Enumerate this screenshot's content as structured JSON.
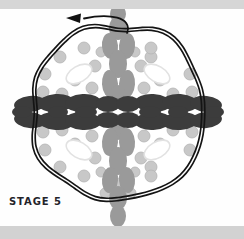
{
  "figure": {
    "title_label": "STAGE 5",
    "caption": "STAGE 5",
    "type": "biological-stage-diagram",
    "background": {
      "page_color": "#ffffff",
      "top_band_color": "#d6d6d6",
      "bottom_band_color": "#d2d2d2",
      "canvas_color": "#fefefe"
    },
    "colors": {
      "outline": "#141414",
      "dark_blob": "#3c3c3c",
      "medium_blob": "#9a9a9a",
      "light_dot": "#c8c8c8",
      "light_dot_stroke": "#b4b4b4",
      "outlined_blob_fill": "#ffffff",
      "outlined_blob_stroke": "#e2e2e2",
      "label_color": "#23232a",
      "arrow_color": "#111111"
    },
    "boundary": {
      "shape": "irregular-wavy-circle",
      "style": "double-line",
      "center_x": 118,
      "center_y": 112,
      "radius_x": 87,
      "radius_y": 88,
      "stroke_width": 1.7,
      "line_gap": 3.2
    },
    "arrow": {
      "name": "rotation-arrow",
      "direction": "left",
      "head_x": 66,
      "head_y": 18,
      "tail_x": 127,
      "tail_y": 33,
      "label": ""
    },
    "horizontal_band": {
      "color": "#3c3c3c",
      "center_y": 112,
      "extends_beyond_boundary": true,
      "left_extent": 14,
      "right_extent": 230
    },
    "vertical_band": {
      "color": "#9a9a9a",
      "center_x": 118,
      "extends_beyond_boundary": true,
      "top_extent": 12,
      "bottom_extent": 228
    },
    "dark_blobs": [
      {
        "cx": 30,
        "cy": 104,
        "rx": 16,
        "ry": 8,
        "rot": -6
      },
      {
        "cx": 30,
        "cy": 120,
        "rx": 16,
        "ry": 8,
        "rot": 6
      },
      {
        "cx": 56,
        "cy": 103,
        "rx": 18,
        "ry": 9,
        "rot": -4
      },
      {
        "cx": 56,
        "cy": 121,
        "rx": 18,
        "ry": 9,
        "rot": 4
      },
      {
        "cx": 58,
        "cy": 112,
        "rx": 10,
        "ry": 6,
        "rot": 0
      },
      {
        "cx": 83,
        "cy": 103,
        "rx": 18,
        "ry": 9,
        "rot": -3
      },
      {
        "cx": 83,
        "cy": 121,
        "rx": 18,
        "ry": 9,
        "rot": 3
      },
      {
        "cx": 86,
        "cy": 112,
        "rx": 11,
        "ry": 6,
        "rot": 0
      },
      {
        "cx": 153,
        "cy": 103,
        "rx": 18,
        "ry": 9,
        "rot": 3
      },
      {
        "cx": 153,
        "cy": 121,
        "rx": 18,
        "ry": 9,
        "rot": -3
      },
      {
        "cx": 150,
        "cy": 112,
        "rx": 11,
        "ry": 6,
        "rot": 0
      },
      {
        "cx": 180,
        "cy": 103,
        "rx": 18,
        "ry": 9,
        "rot": 4
      },
      {
        "cx": 180,
        "cy": 121,
        "rx": 18,
        "ry": 9,
        "rot": -4
      },
      {
        "cx": 178,
        "cy": 112,
        "rx": 10,
        "ry": 6,
        "rot": 0
      },
      {
        "cx": 206,
        "cy": 104,
        "rx": 16,
        "ry": 8,
        "rot": 6
      },
      {
        "cx": 206,
        "cy": 120,
        "rx": 16,
        "ry": 8,
        "rot": -6
      },
      {
        "cx": 108,
        "cy": 104,
        "rx": 12,
        "ry": 8,
        "rot": 0
      },
      {
        "cx": 128,
        "cy": 104,
        "rx": 12,
        "ry": 8,
        "rot": 0
      },
      {
        "cx": 108,
        "cy": 120,
        "rx": 12,
        "ry": 8,
        "rot": 0
      },
      {
        "cx": 128,
        "cy": 120,
        "rx": 12,
        "ry": 8,
        "rot": 0
      },
      {
        "cx": 22,
        "cy": 112,
        "rx": 10,
        "ry": 6,
        "rot": 0
      },
      {
        "cx": 214,
        "cy": 112,
        "rx": 10,
        "ry": 6,
        "rot": 0
      }
    ],
    "medium_blobs": [
      {
        "cx": 118,
        "cy": 28,
        "rx": 9,
        "ry": 12,
        "rot": 0
      },
      {
        "cx": 110,
        "cy": 46,
        "rx": 8,
        "ry": 13,
        "rot": -5
      },
      {
        "cx": 127,
        "cy": 46,
        "rx": 8,
        "ry": 13,
        "rot": 5
      },
      {
        "cx": 118,
        "cy": 64,
        "rx": 9,
        "ry": 14,
        "rot": 0
      },
      {
        "cx": 110,
        "cy": 84,
        "rx": 8,
        "ry": 14,
        "rot": -4
      },
      {
        "cx": 127,
        "cy": 84,
        "rx": 8,
        "ry": 14,
        "rot": 4
      },
      {
        "cx": 118,
        "cy": 95,
        "rx": 8,
        "ry": 10,
        "rot": 0
      },
      {
        "cx": 118,
        "cy": 130,
        "rx": 8,
        "ry": 10,
        "rot": 0
      },
      {
        "cx": 110,
        "cy": 142,
        "rx": 8,
        "ry": 14,
        "rot": 4
      },
      {
        "cx": 127,
        "cy": 142,
        "rx": 8,
        "ry": 14,
        "rot": -4
      },
      {
        "cx": 118,
        "cy": 161,
        "rx": 9,
        "ry": 14,
        "rot": 0
      },
      {
        "cx": 110,
        "cy": 180,
        "rx": 8,
        "ry": 13,
        "rot": 5
      },
      {
        "cx": 127,
        "cy": 180,
        "rx": 8,
        "ry": 13,
        "rot": -5
      },
      {
        "cx": 118,
        "cy": 198,
        "rx": 9,
        "ry": 12,
        "rot": 0
      },
      {
        "cx": 118,
        "cy": 216,
        "rx": 8,
        "ry": 11,
        "rot": 0
      },
      {
        "cx": 118,
        "cy": 14,
        "rx": 8,
        "ry": 9,
        "rot": 0
      }
    ],
    "light_dots": [
      {
        "cx": 60,
        "cy": 57,
        "r": 6
      },
      {
        "cx": 84,
        "cy": 48,
        "r": 6
      },
      {
        "cx": 95,
        "cy": 66,
        "r": 6
      },
      {
        "cx": 75,
        "cy": 80,
        "r": 6
      },
      {
        "cx": 62,
        "cy": 94,
        "r": 6
      },
      {
        "cx": 92,
        "cy": 88,
        "r": 6
      },
      {
        "cx": 45,
        "cy": 74,
        "r": 6
      },
      {
        "cx": 43,
        "cy": 92,
        "r": 6
      },
      {
        "cx": 151,
        "cy": 57,
        "r": 6
      },
      {
        "cx": 151,
        "cy": 48,
        "r": 6
      },
      {
        "cx": 141,
        "cy": 66,
        "r": 6
      },
      {
        "cx": 160,
        "cy": 80,
        "r": 6
      },
      {
        "cx": 173,
        "cy": 94,
        "r": 6
      },
      {
        "cx": 144,
        "cy": 88,
        "r": 6
      },
      {
        "cx": 190,
        "cy": 74,
        "r": 6
      },
      {
        "cx": 192,
        "cy": 92,
        "r": 6
      },
      {
        "cx": 60,
        "cy": 167,
        "r": 6
      },
      {
        "cx": 84,
        "cy": 176,
        "r": 6
      },
      {
        "cx": 95,
        "cy": 158,
        "r": 6
      },
      {
        "cx": 75,
        "cy": 144,
        "r": 6
      },
      {
        "cx": 62,
        "cy": 130,
        "r": 6
      },
      {
        "cx": 92,
        "cy": 136,
        "r": 6
      },
      {
        "cx": 45,
        "cy": 150,
        "r": 6
      },
      {
        "cx": 43,
        "cy": 132,
        "r": 6
      },
      {
        "cx": 151,
        "cy": 167,
        "r": 6
      },
      {
        "cx": 151,
        "cy": 176,
        "r": 6
      },
      {
        "cx": 141,
        "cy": 158,
        "r": 6
      },
      {
        "cx": 160,
        "cy": 144,
        "r": 6
      },
      {
        "cx": 173,
        "cy": 130,
        "r": 6
      },
      {
        "cx": 144,
        "cy": 136,
        "r": 6
      },
      {
        "cx": 190,
        "cy": 150,
        "r": 6
      },
      {
        "cx": 192,
        "cy": 132,
        "r": 6
      },
      {
        "cx": 101,
        "cy": 52,
        "r": 5
      },
      {
        "cx": 135,
        "cy": 52,
        "r": 5
      },
      {
        "cx": 101,
        "cy": 172,
        "r": 5
      },
      {
        "cx": 135,
        "cy": 172,
        "r": 5
      },
      {
        "cx": 118,
        "cy": 183,
        "r": 5
      },
      {
        "cx": 105,
        "cy": 193,
        "r": 5
      },
      {
        "cx": 131,
        "cy": 193,
        "r": 5
      }
    ],
    "outlined_blobs": [
      {
        "cx": 79,
        "cy": 74,
        "rx": 14,
        "ry": 8,
        "rot": -30
      },
      {
        "cx": 157,
        "cy": 74,
        "rx": 14,
        "ry": 8,
        "rot": 30
      },
      {
        "cx": 79,
        "cy": 150,
        "rx": 14,
        "ry": 8,
        "rot": 30
      },
      {
        "cx": 157,
        "cy": 150,
        "rx": 14,
        "ry": 8,
        "rot": -30
      }
    ]
  }
}
